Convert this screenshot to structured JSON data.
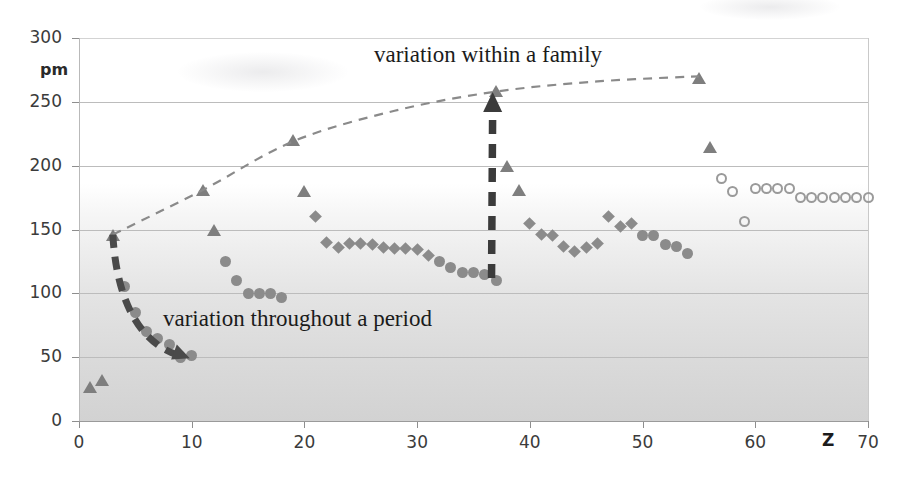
{
  "chart_data": {
    "type": "scatter",
    "title": "",
    "xlabel": "Z",
    "ylabel": "pm",
    "xlim": [
      0,
      70
    ],
    "ylim": [
      0,
      300
    ],
    "grid": true,
    "legend_position": "none",
    "x_ticks": [
      "0",
      "10",
      "20",
      "30",
      "40",
      "50",
      "60",
      "70"
    ],
    "x_tick_values": [
      0,
      10,
      20,
      30,
      40,
      50,
      60,
      70
    ],
    "y_ticks": [
      "0",
      "50",
      "100",
      "150",
      "200",
      "250",
      "300"
    ],
    "y_tick_values": [
      0,
      50,
      100,
      150,
      200,
      250,
      300
    ],
    "annotations": [
      {
        "id": "anno-family",
        "text": "variation within a family",
        "x": 20,
        "y": 278
      },
      {
        "id": "anno-period",
        "text": "variation throughout a period",
        "x": 8.5,
        "y": 80
      }
    ],
    "arrows": [
      {
        "id": "arrow-period",
        "style": "dashed-curve-down",
        "from": {
          "x": 3.0,
          "y": 146
        },
        "to": {
          "x": 9.3,
          "y": 50
        }
      },
      {
        "id": "arrow-family",
        "style": "dashed-straight-up",
        "from": {
          "x": 36.6,
          "y": 112
        },
        "to": {
          "x": 36.7,
          "y": 253
        }
      }
    ],
    "trend_curve": {
      "id": "trend-dashed",
      "style": "dashed",
      "description": "dashed curve through the alkali-metal maxima",
      "points": [
        {
          "x": 3,
          "y": 146
        },
        {
          "x": 11,
          "y": 181
        },
        {
          "x": 19,
          "y": 219
        },
        {
          "x": 28,
          "y": 243
        },
        {
          "x": 37,
          "y": 258
        },
        {
          "x": 46,
          "y": 266
        },
        {
          "x": 55,
          "y": 270
        }
      ]
    },
    "series": [
      {
        "name": "alkali-and-group-markers",
        "marker": "triangle",
        "color": "#7e7e7e",
        "points": [
          {
            "x": 1,
            "y": 26
          },
          {
            "x": 2,
            "y": 31
          },
          {
            "x": 3,
            "y": 145
          },
          {
            "x": 11,
            "y": 180
          },
          {
            "x": 12,
            "y": 149
          },
          {
            "x": 19,
            "y": 219
          },
          {
            "x": 20,
            "y": 179
          },
          {
            "x": 37,
            "y": 258
          },
          {
            "x": 38,
            "y": 199
          },
          {
            "x": 39,
            "y": 180
          },
          {
            "x": 55,
            "y": 268
          },
          {
            "x": 56,
            "y": 214
          }
        ]
      },
      {
        "name": "period-2-3-filled-circles",
        "marker": "circle",
        "color": "#8b8b8b",
        "points": [
          {
            "x": 4,
            "y": 105
          },
          {
            "x": 5,
            "y": 85
          },
          {
            "x": 6,
            "y": 70
          },
          {
            "x": 7,
            "y": 65
          },
          {
            "x": 8,
            "y": 60
          },
          {
            "x": 9,
            "y": 50
          },
          {
            "x": 10,
            "y": 51
          },
          {
            "x": 13,
            "y": 125
          },
          {
            "x": 14,
            "y": 110
          },
          {
            "x": 15,
            "y": 100
          },
          {
            "x": 16,
            "y": 100
          },
          {
            "x": 17,
            "y": 100
          },
          {
            "x": 18,
            "y": 97
          }
        ]
      },
      {
        "name": "transition-row-4",
        "marker": "diamond",
        "color": "#8b8b8b",
        "points": [
          {
            "x": 21,
            "y": 160
          },
          {
            "x": 22,
            "y": 140
          },
          {
            "x": 23,
            "y": 136
          },
          {
            "x": 24,
            "y": 139
          },
          {
            "x": 25,
            "y": 139
          },
          {
            "x": 26,
            "y": 138
          },
          {
            "x": 27,
            "y": 136
          },
          {
            "x": 28,
            "y": 135
          },
          {
            "x": 29,
            "y": 135
          },
          {
            "x": 30,
            "y": 134
          },
          {
            "x": 31,
            "y": 130
          }
        ]
      },
      {
        "name": "period-4-p-block",
        "marker": "circle",
        "color": "#8b8b8b",
        "points": [
          {
            "x": 32,
            "y": 125
          },
          {
            "x": 33,
            "y": 120
          },
          {
            "x": 34,
            "y": 116
          },
          {
            "x": 35,
            "y": 116
          },
          {
            "x": 36,
            "y": 115
          },
          {
            "x": 37,
            "y": 110
          }
        ]
      },
      {
        "name": "transition-row-5",
        "marker": "diamond",
        "color": "#8b8b8b",
        "points": [
          {
            "x": 40,
            "y": 155
          },
          {
            "x": 41,
            "y": 146
          },
          {
            "x": 42,
            "y": 145
          },
          {
            "x": 43,
            "y": 137
          },
          {
            "x": 44,
            "y": 133
          },
          {
            "x": 45,
            "y": 136
          },
          {
            "x": 46,
            "y": 139
          },
          {
            "x": 47,
            "y": 160
          },
          {
            "x": 48,
            "y": 152
          },
          {
            "x": 49,
            "y": 155
          }
        ]
      },
      {
        "name": "period-5-p-block",
        "marker": "circle",
        "color": "#8b8b8b",
        "points": [
          {
            "x": 50,
            "y": 145
          },
          {
            "x": 51,
            "y": 145
          },
          {
            "x": 52,
            "y": 138
          },
          {
            "x": 53,
            "y": 137
          },
          {
            "x": 54,
            "y": 131
          }
        ]
      },
      {
        "name": "lanthanides-open-circles",
        "marker": "circle-open",
        "color": "#9a9a9a",
        "points": [
          {
            "x": 57,
            "y": 190
          },
          {
            "x": 58,
            "y": 180
          },
          {
            "x": 59,
            "y": 156
          },
          {
            "x": 60,
            "y": 182
          },
          {
            "x": 61,
            "y": 182
          },
          {
            "x": 62,
            "y": 182
          },
          {
            "x": 63,
            "y": 182
          },
          {
            "x": 64,
            "y": 175
          },
          {
            "x": 65,
            "y": 175
          },
          {
            "x": 66,
            "y": 175
          },
          {
            "x": 67,
            "y": 175
          },
          {
            "x": 68,
            "y": 175
          },
          {
            "x": 69,
            "y": 175
          },
          {
            "x": 70,
            "y": 175
          }
        ]
      }
    ]
  },
  "axes": {
    "y_unit_label": "pm",
    "x_axis_symbol": "Z"
  }
}
